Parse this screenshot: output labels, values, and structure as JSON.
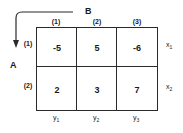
{
  "diagram": {
    "type": "payoff-matrix",
    "player_row": "A",
    "player_col": "B",
    "col_headers": [
      "(1)",
      "(2)",
      "(3)"
    ],
    "row_headers": [
      "(1)",
      "(2)"
    ],
    "cells": [
      [
        "-5",
        "5",
        "-6"
      ],
      [
        "2",
        "3",
        "7"
      ]
    ],
    "row_vars": [
      {
        "base": "x",
        "sub": "1"
      },
      {
        "base": "x",
        "sub": "2"
      }
    ],
    "col_vars": [
      {
        "base": "y",
        "sub": "1"
      },
      {
        "base": "y",
        "sub": "2"
      },
      {
        "base": "y",
        "sub": "3"
      }
    ]
  }
}
